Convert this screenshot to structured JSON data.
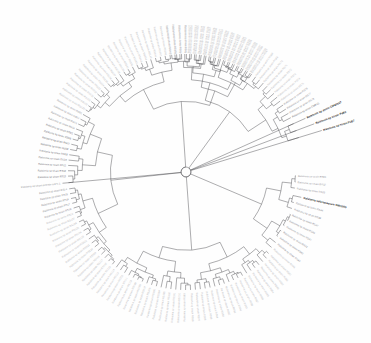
{
  "figure": {
    "kind": "circular-phylogenetic-tree",
    "type": "dendrogram-radial",
    "background_color": "#fefefe",
    "branch_color": "#3a3a3f",
    "label_color": "#b9b9bc",
    "highlight_color": "#1d1d1d",
    "center": {
      "x": 186,
      "y": 172
    },
    "inner_radius": 9,
    "outer_radius": 118,
    "label_radius": 121,
    "tip_count": 152,
    "title": "",
    "axis_labels": [],
    "legend": [],
    "scale_bar": ""
  },
  "highlighted_taxa": [
    "Ralstonia sp strain CMR15",
    "Ralstonia sp strain CIP9055T",
    "Ralstonia sp strain PsB2",
    "Ralstonia sp strain PsB7",
    "Ralstonia solanacearum GMI1000"
  ],
  "tips": [
    {
      "label": "Ralstonia sp strain RS50",
      "angle": -97.0,
      "radius": 118,
      "style": "pale"
    },
    {
      "label": "Ralstonia sp strain RS51",
      "angle": -94.6,
      "radius": 118,
      "style": "pale"
    },
    {
      "label": "Ralstonia sp strain RS52",
      "angle": -92.2,
      "radius": 118,
      "style": "pale"
    },
    {
      "label": "Ralstonia sp strain RS53",
      "angle": -89.8,
      "radius": 118,
      "style": "pale"
    },
    {
      "label": "Ralstonia sp strain RS54",
      "angle": -87.4,
      "radius": 118,
      "style": "pale"
    },
    {
      "label": "Ralstonia sp strain RS55",
      "angle": -85.0,
      "radius": 118,
      "style": "pale"
    },
    {
      "label": "Ralstonia sp strain RS56",
      "angle": -82.6,
      "radius": 118,
      "style": "pale"
    },
    {
      "label": "Ralstonia sp strain RS57",
      "angle": -80.2,
      "radius": 118,
      "style": "pale"
    },
    {
      "label": "Ralstonia sp strain RS58",
      "angle": -77.8,
      "radius": 118,
      "style": "pale"
    },
    {
      "label": "Ralstonia sp strain RS59",
      "angle": -75.4,
      "radius": 118,
      "style": "pale"
    },
    {
      "label": "Ralstonia sp strain RS60",
      "angle": -73.0,
      "radius": 118,
      "style": "pale"
    },
    {
      "label": "Ralstonia sp strain RS61",
      "angle": -70.6,
      "radius": 118,
      "style": "pale"
    },
    {
      "label": "Ralstonia sp strain RS62",
      "angle": -68.2,
      "radius": 118,
      "style": "pale"
    },
    {
      "label": "Ralstonia sp strain RS63",
      "angle": -65.8,
      "radius": 118,
      "style": "pale"
    },
    {
      "label": "Ralstonia sp strain RS64",
      "angle": -63.4,
      "radius": 118,
      "style": "pale"
    },
    {
      "label": "Ralstonia sp strain RS65",
      "angle": -61.0,
      "radius": 118,
      "style": "pale"
    },
    {
      "label": "Ralstonia sp strain RS66",
      "angle": -58.6,
      "radius": 118,
      "style": "pale"
    },
    {
      "label": "Ralstonia sp strain RS67",
      "angle": -56.2,
      "radius": 118,
      "style": "pale"
    },
    {
      "label": "Ralstonia sp strain RS68",
      "angle": -53.8,
      "radius": 118,
      "style": "pale"
    },
    {
      "label": "Ralstonia sp strain RS69",
      "angle": -51.4,
      "radius": 118,
      "style": "pale"
    },
    {
      "label": "Ralstonia sp strain RS70",
      "angle": -49.0,
      "radius": 118,
      "style": "pale"
    },
    {
      "label": "Ralstonia sp strain RS71",
      "angle": -46.6,
      "radius": 118,
      "style": "pale"
    },
    {
      "label": "Ralstonia sp strain RS72",
      "angle": -44.2,
      "radius": 118,
      "style": "pale"
    },
    {
      "label": "Ralstonia sp strain RS73",
      "angle": -41.8,
      "radius": 118,
      "style": "pale"
    },
    {
      "label": "Ralstonia sp strain RS74",
      "angle": -39.4,
      "radius": 118,
      "style": "pale"
    },
    {
      "label": "Ralstonia sp strain RS75",
      "angle": -37.0,
      "radius": 118,
      "style": "pale"
    },
    {
      "label": "Ralstonia sp strain RS76",
      "angle": -34.6,
      "radius": 118,
      "style": "mid"
    },
    {
      "label": "Ralstonia sp strain RS77",
      "angle": -32.2,
      "radius": 118,
      "style": "mid"
    },
    {
      "label": "Ralstonia sp strain RS78",
      "angle": -29.8,
      "radius": 118,
      "style": "mid"
    },
    {
      "label": "Ralstonia sp strain CMR15",
      "angle": -27.4,
      "radius": 118,
      "style": "dark"
    },
    {
      "label": "Ralstonia sp strain CIP9055T",
      "angle": -24.2,
      "radius": 131,
      "style": "bold"
    },
    {
      "label": "Ralstonia sp strain PsB2",
      "angle": -20.6,
      "radius": 137,
      "style": "bold"
    },
    {
      "label": "Ralstonia sp strain PsB7",
      "angle": -17.0,
      "radius": 142,
      "style": "bold"
    },
    {
      "label": "Ralstonia sp strain RS31",
      "angle": 2.0,
      "radius": 110,
      "style": "mid"
    },
    {
      "label": "Ralstonia sp strain RS32",
      "angle": 5.2,
      "radius": 110,
      "style": "mid"
    },
    {
      "label": "Ralstonia sp strain RS33",
      "angle": 8.4,
      "radius": 110,
      "style": "mid"
    },
    {
      "label": "Ralstonia solanacearum GMI1000",
      "angle": 12.4,
      "radius": 118,
      "style": "bold"
    },
    {
      "label": "Ralstonia sp strain RS44",
      "angle": 15.8,
      "radius": 112,
      "style": "mid"
    },
    {
      "label": "Ralstonia sp strain RS38",
      "angle": 19.0,
      "radius": 112,
      "style": "mid"
    },
    {
      "label": "Ralstonia sp strain RS47",
      "angle": 22.2,
      "radius": 112,
      "style": "mid"
    },
    {
      "label": "Ralstonia sp strain RS48",
      "angle": 25.4,
      "radius": 112,
      "style": "mid"
    },
    {
      "label": "Ralstonia sp strain RS41",
      "angle": 28.6,
      "radius": 112,
      "style": "mid"
    },
    {
      "label": "Ralstonia sp strain RS42",
      "angle": 31.8,
      "radius": 112,
      "style": "mid"
    },
    {
      "label": "Ralstonia sp strain RS43",
      "angle": 35.0,
      "radius": 112,
      "style": "mid"
    },
    {
      "label": "Ralstonia sp strain RS45",
      "angle": 38.2,
      "radius": 114,
      "style": "mid"
    },
    {
      "label": "Ralstonia sp strain RS46",
      "angle": 41.4,
      "radius": 114,
      "style": "pale"
    },
    {
      "label": "Ralstonia sp strain RS80",
      "angle": 44.6,
      "radius": 116,
      "style": "pale"
    },
    {
      "label": "Ralstonia sp strain RS81",
      "angle": 47.0,
      "radius": 118,
      "style": "pale"
    },
    {
      "label": "Ralstonia sp strain RS82",
      "angle": 49.4,
      "radius": 118,
      "style": "pale"
    },
    {
      "label": "Ralstonia sp strain RS83",
      "angle": 51.8,
      "radius": 118,
      "style": "pale"
    },
    {
      "label": "Ralstonia sp strain RS84",
      "angle": 54.2,
      "radius": 118,
      "style": "pale"
    },
    {
      "label": "Ralstonia sp strain RS85",
      "angle": 56.6,
      "radius": 118,
      "style": "pale"
    },
    {
      "label": "Ralstonia sp strain RS86",
      "angle": 59.0,
      "radius": 118,
      "style": "pale"
    },
    {
      "label": "Ralstonia sp strain RS87",
      "angle": 61.4,
      "radius": 118,
      "style": "pale"
    },
    {
      "label": "Ralstonia sp strain RS88",
      "angle": 63.8,
      "radius": 118,
      "style": "pale"
    },
    {
      "label": "Ralstonia sp strain RS89",
      "angle": 66.2,
      "radius": 118,
      "style": "pale"
    },
    {
      "label": "Ralstonia sp strain RS90",
      "angle": 68.6,
      "radius": 118,
      "style": "pale"
    },
    {
      "label": "Ralstonia sp strain RS91",
      "angle": 71.0,
      "radius": 118,
      "style": "pale"
    },
    {
      "label": "Ralstonia sp strain RS92",
      "angle": 73.4,
      "radius": 118,
      "style": "pale"
    },
    {
      "label": "Ralstonia sp strain RS93",
      "angle": 75.8,
      "radius": 118,
      "style": "pale"
    },
    {
      "label": "Ralstonia sp strain RS94",
      "angle": 78.2,
      "radius": 118,
      "style": "pale"
    },
    {
      "label": "Ralstonia sp strain RS95",
      "angle": 80.6,
      "radius": 118,
      "style": "pale"
    },
    {
      "label": "Ralstonia sp strain RS96",
      "angle": 83.0,
      "radius": 118,
      "style": "pale"
    },
    {
      "label": "Ralstonia sp strain RS97",
      "angle": 85.4,
      "radius": 118,
      "style": "pale"
    },
    {
      "label": "Ralstonia sp strain RS98",
      "angle": 87.8,
      "radius": 118,
      "style": "pale"
    },
    {
      "label": "Ralstonia sp strain RS99",
      "angle": 90.2,
      "radius": 118,
      "style": "pale"
    },
    {
      "label": "Ralstonia sp strain RS100",
      "angle": 92.6,
      "radius": 118,
      "style": "pale"
    },
    {
      "label": "Ralstonia sp strain RS101",
      "angle": 95.0,
      "radius": 118,
      "style": "pale"
    },
    {
      "label": "Ralstonia sp strain RS102",
      "angle": 97.4,
      "radius": 118,
      "style": "pale"
    },
    {
      "label": "Ralstonia sp strain RS103",
      "angle": 99.8,
      "radius": 118,
      "style": "pale"
    },
    {
      "label": "Ralstonia sp strain RS104",
      "angle": 102.2,
      "radius": 118,
      "style": "pale"
    },
    {
      "label": "Ralstonia sp strain RS105",
      "angle": 104.6,
      "radius": 118,
      "style": "pale"
    },
    {
      "label": "Ralstonia sp strain RS106",
      "angle": 107.0,
      "radius": 118,
      "style": "pale"
    },
    {
      "label": "Ralstonia sp strain RS107",
      "angle": 109.4,
      "radius": 118,
      "style": "pale"
    },
    {
      "label": "Ralstonia sp strain RS108",
      "angle": 111.8,
      "radius": 118,
      "style": "pale"
    },
    {
      "label": "Ralstonia sp strain RS109",
      "angle": 114.2,
      "radius": 118,
      "style": "pale"
    },
    {
      "label": "Ralstonia sp strain RS110",
      "angle": 116.6,
      "radius": 118,
      "style": "pale"
    },
    {
      "label": "Ralstonia sp strain RS111",
      "angle": 119.0,
      "radius": 118,
      "style": "pale"
    },
    {
      "label": "Ralstonia sp strain RS112",
      "angle": 121.4,
      "radius": 118,
      "style": "pale"
    },
    {
      "label": "Ralstonia sp strain RS113",
      "angle": 123.8,
      "radius": 118,
      "style": "pale"
    },
    {
      "label": "Ralstonia sp strain RS114",
      "angle": 126.2,
      "radius": 118,
      "style": "pale"
    },
    {
      "label": "Ralstonia sp strain RS115",
      "angle": 128.6,
      "radius": 118,
      "style": "pale"
    },
    {
      "label": "Ralstonia sp strain RS116",
      "angle": 131.0,
      "radius": 118,
      "style": "pale"
    },
    {
      "label": "Ralstonia sp strain RS117",
      "angle": 133.4,
      "radius": 118,
      "style": "pale"
    },
    {
      "label": "Ralstonia sp strain RS118",
      "angle": 135.8,
      "radius": 118,
      "style": "pale"
    },
    {
      "label": "Ralstonia sp strain RS119",
      "angle": 138.2,
      "radius": 118,
      "style": "pale"
    },
    {
      "label": "Ralstonia sp strain RS120",
      "angle": 140.6,
      "radius": 118,
      "style": "pale"
    },
    {
      "label": "Ralstonia sp strain RS121",
      "angle": 143.0,
      "radius": 118,
      "style": "pale"
    },
    {
      "label": "Ralstonia sp strain RS122",
      "angle": 145.4,
      "radius": 118,
      "style": "pale"
    },
    {
      "label": "Ralstonia sp strain RS123",
      "angle": 147.8,
      "radius": 118,
      "style": "pale"
    },
    {
      "label": "Ralstonia sp strain RS124",
      "angle": 150.2,
      "radius": 118,
      "style": "pale"
    },
    {
      "label": "Ralstonia sp strain RS125",
      "angle": 152.6,
      "radius": 118,
      "style": "pale"
    },
    {
      "label": "Ralstonia sp strain RS126",
      "angle": 155.0,
      "radius": 118,
      "style": "pale"
    },
    {
      "label": "Ralstonia sp strain RS127",
      "angle": 157.4,
      "radius": 118,
      "style": "pale"
    },
    {
      "label": "Ralstonia sp strain RS19",
      "angle": 159.8,
      "radius": 118,
      "style": "pale"
    },
    {
      "label": "Ralstonia sp strain RS18",
      "angle": 162.2,
      "radius": 118,
      "style": "mid"
    },
    {
      "label": "Ralstonia sp strain RS17",
      "angle": 164.6,
      "radius": 118,
      "style": "mid"
    },
    {
      "label": "Ralstonia sp strain RS16",
      "angle": 167.0,
      "radius": 118,
      "style": "mid"
    },
    {
      "label": "Ralstonia sp strain RS15",
      "angle": 169.4,
      "radius": 118,
      "style": "mid"
    },
    {
      "label": "Ralstonia sp strain RS14",
      "angle": 171.8,
      "radius": 118,
      "style": "mid"
    },
    {
      "label": "Ralstonia sp strain pickettii GIPS-1",
      "angle": 174.8,
      "radius": 124,
      "style": "mid"
    },
    {
      "label": "Ralstonia sp strain RS13",
      "angle": 178.0,
      "radius": 118,
      "style": "dark"
    },
    {
      "label": "Ralstonia sp strain RS12",
      "angle": 180.6,
      "radius": 118,
      "style": "dark"
    },
    {
      "label": "Ralstonia sp strain RS11",
      "angle": 183.2,
      "radius": 118,
      "style": "dark"
    },
    {
      "label": "Ralstonia sp strain RS10",
      "angle": 185.8,
      "radius": 118,
      "style": "dark"
    },
    {
      "label": "Ralstonia sp strain RS09",
      "angle": 188.4,
      "radius": 118,
      "style": "dark"
    },
    {
      "label": "Ralstonia sp strain RS08",
      "angle": 191.0,
      "radius": 118,
      "style": "dark"
    },
    {
      "label": "Ralstonia sp strain RS07",
      "angle": 193.6,
      "radius": 118,
      "style": "dark"
    },
    {
      "label": "Ralstonia sp strain RS06",
      "angle": 196.2,
      "radius": 118,
      "style": "dark"
    },
    {
      "label": "Ralstonia sp strain RS05",
      "angle": 198.8,
      "radius": 118,
      "style": "dark"
    },
    {
      "label": "Ralstonia sp strain RS04",
      "angle": 201.4,
      "radius": 118,
      "style": "mid"
    },
    {
      "label": "Ralstonia sp strain RS03",
      "angle": 204.0,
      "radius": 118,
      "style": "mid"
    },
    {
      "label": "Ralstonia sp strain RS02",
      "angle": 206.6,
      "radius": 118,
      "style": "mid"
    },
    {
      "label": "Ralstonia sp strain RS01",
      "angle": 209.2,
      "radius": 118,
      "style": "mid"
    },
    {
      "label": "Ralstonia sp strain RS128",
      "angle": 211.8,
      "radius": 118,
      "style": "pale"
    },
    {
      "label": "Ralstonia sp strain RS129",
      "angle": 214.2,
      "radius": 118,
      "style": "pale"
    },
    {
      "label": "Ralstonia sp strain RS130",
      "angle": 216.6,
      "radius": 118,
      "style": "pale"
    },
    {
      "label": "Ralstonia sp strain RS131",
      "angle": 219.0,
      "radius": 118,
      "style": "pale"
    },
    {
      "label": "Ralstonia sp strain RS132",
      "angle": 221.4,
      "radius": 118,
      "style": "pale"
    },
    {
      "label": "Ralstonia sp strain RS133",
      "angle": 223.8,
      "radius": 118,
      "style": "pale"
    },
    {
      "label": "Ralstonia sp strain RS134",
      "angle": 226.2,
      "radius": 118,
      "style": "pale"
    },
    {
      "label": "Ralstonia sp strain RS135",
      "angle": 228.6,
      "radius": 118,
      "style": "pale"
    },
    {
      "label": "Ralstonia sp strain RS136",
      "angle": 231.0,
      "radius": 118,
      "style": "pale"
    },
    {
      "label": "Ralstonia sp strain RS137",
      "angle": 233.4,
      "radius": 118,
      "style": "pale"
    },
    {
      "label": "Ralstonia sp strain RS138",
      "angle": 235.8,
      "radius": 118,
      "style": "pale"
    },
    {
      "label": "Ralstonia sp strain RS139",
      "angle": 238.2,
      "radius": 118,
      "style": "pale"
    },
    {
      "label": "Ralstonia sp strain RS140",
      "angle": 240.6,
      "radius": 118,
      "style": "pale"
    },
    {
      "label": "Ralstonia sp strain RS141",
      "angle": 243.0,
      "radius": 118,
      "style": "pale"
    },
    {
      "label": "Ralstonia sp strain RS142",
      "angle": 245.4,
      "radius": 118,
      "style": "pale"
    },
    {
      "label": "Ralstonia sp strain RS143",
      "angle": 247.8,
      "radius": 118,
      "style": "pale"
    },
    {
      "label": "Ralstonia sp strain RS144",
      "angle": 250.2,
      "radius": 118,
      "style": "pale"
    },
    {
      "label": "Ralstonia sp strain RS145",
      "angle": 252.6,
      "radius": 118,
      "style": "pale"
    },
    {
      "label": "Ralstonia sp strain RS146",
      "angle": 255.0,
      "radius": 118,
      "style": "pale"
    },
    {
      "label": "Ralstonia sp strain RS147",
      "angle": 257.4,
      "radius": 118,
      "style": "pale"
    },
    {
      "label": "Ralstonia sp strain RS148",
      "angle": 259.8,
      "radius": 118,
      "style": "pale"
    },
    {
      "label": "Ralstonia sp strain RS149",
      "angle": 262.2,
      "radius": 118,
      "style": "pale"
    },
    {
      "label": "Ralstonia sp strain RS150",
      "angle": 264.6,
      "radius": 118,
      "style": "pale"
    },
    {
      "label": "Ralstonia sp strain RS20",
      "angle": 267.0,
      "radius": 118,
      "style": "pale"
    },
    {
      "label": "Ralstonia sp strain RS21",
      "angle": 269.4,
      "radius": 118,
      "style": "pale"
    },
    {
      "label": "Ralstonia sp strain RS22",
      "angle": 271.8,
      "radius": 118,
      "style": "pale"
    },
    {
      "label": "Ralstonia sp strain RS23",
      "angle": 274.2,
      "radius": 118,
      "style": "pale"
    },
    {
      "label": "Ralstonia sp strain RS24",
      "angle": 276.6,
      "radius": 118,
      "style": "pale"
    },
    {
      "label": "Ralstonia sp strain RS25",
      "angle": 279.0,
      "radius": 118,
      "style": "pale"
    },
    {
      "label": "Ralstonia sp strain RS26",
      "angle": 281.4,
      "radius": 118,
      "style": "pale"
    },
    {
      "label": "Ralstonia sp strain RS27",
      "angle": 283.8,
      "radius": 118,
      "style": "pale"
    },
    {
      "label": "Ralstonia sp strain RS28",
      "angle": 286.2,
      "radius": 118,
      "style": "pale"
    },
    {
      "label": "Ralstonia sp strain RS29",
      "angle": 288.6,
      "radius": 118,
      "style": "pale"
    },
    {
      "label": "Ralstonia sp strain RS30",
      "angle": 291.0,
      "radius": 118,
      "style": "pale"
    },
    {
      "label": "Ralstonia sp strain RS34",
      "angle": 293.4,
      "radius": 118,
      "style": "pale"
    },
    {
      "label": "Ralstonia sp strain RS35",
      "angle": 295.8,
      "radius": 118,
      "style": "pale"
    },
    {
      "label": "Ralstonia sp strain RS36",
      "angle": 298.2,
      "radius": 118,
      "style": "pale"
    },
    {
      "label": "Ralstonia sp strain RS37",
      "angle": 300.6,
      "radius": 118,
      "style": "pale"
    },
    {
      "label": "Ralstonia sp strain RS39",
      "angle": 303.0,
      "radius": 118,
      "style": "pale"
    }
  ],
  "clades": [
    {
      "name": "clade-upper-right",
      "a0": -97.0,
      "a1": -17.0,
      "depth": 0.62
    },
    {
      "name": "clade-right-gmi",
      "a0": 2.0,
      "a1": 41.4,
      "depth": 0.55
    },
    {
      "name": "clade-lower-right",
      "a0": 44.6,
      "a1": 127.0,
      "depth": 0.7
    },
    {
      "name": "clade-left-upper",
      "a0": 128.6,
      "a1": 209.2,
      "depth": 0.66
    },
    {
      "name": "clade-lower-left",
      "a0": 211.8,
      "a1": 303.0,
      "depth": 0.72
    }
  ]
}
